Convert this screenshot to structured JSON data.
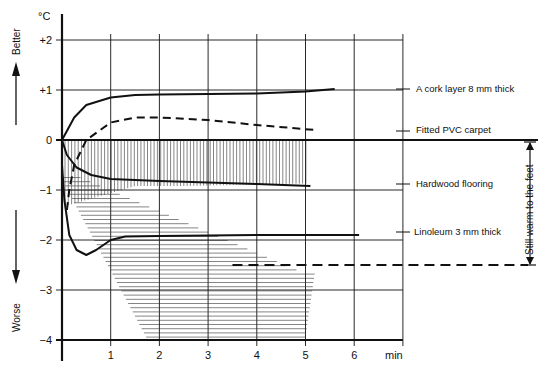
{
  "chart_data": {
    "type": "line",
    "title": "",
    "xlabel": "min",
    "ylabel": "°C",
    "xlim": [
      0,
      7
    ],
    "ylim": [
      -4,
      2
    ],
    "x_ticks": [
      "1",
      "2",
      "3",
      "4",
      "5",
      "6"
    ],
    "y_ticks": [
      "+2",
      "+1",
      "0",
      "−1",
      "−2",
      "−3",
      "−4"
    ],
    "grid": true,
    "annotations": {
      "better": "Better",
      "worse": "Worse",
      "warm_zone": "Still warm to the feet",
      "warm_threshold": -2.5
    },
    "series": [
      {
        "name": "A cork layer 8 mm thick",
        "style": "solid",
        "x": [
          0,
          0.25,
          0.5,
          1,
          1.5,
          2,
          3,
          4,
          5,
          5.6
        ],
        "y": [
          0,
          0.45,
          0.7,
          0.85,
          0.9,
          0.91,
          0.92,
          0.93,
          0.97,
          1.02
        ]
      },
      {
        "name": "Fitted PVC carpet",
        "style": "dashed",
        "x": [
          0.1,
          0.15,
          0.25,
          0.5,
          1,
          1.5,
          2,
          3,
          4,
          5.2
        ],
        "y": [
          -1.4,
          -1.0,
          -0.5,
          0,
          0.35,
          0.45,
          0.45,
          0.4,
          0.3,
          0.2
        ]
      },
      {
        "name": "Hardwood flooring",
        "style": "solid",
        "x": [
          0,
          0.1,
          0.3,
          0.6,
          1,
          1.5,
          2,
          3,
          4,
          5.1
        ],
        "y": [
          0,
          -0.3,
          -0.55,
          -0.7,
          -0.78,
          -0.8,
          -0.82,
          -0.85,
          -0.88,
          -0.92
        ]
      },
      {
        "name": "Linoleum 3 mm thick",
        "style": "solid",
        "x": [
          0,
          0.05,
          0.15,
          0.3,
          0.5,
          0.7,
          1,
          1.3,
          2,
          3,
          4,
          5,
          6.1
        ],
        "y": [
          -0.5,
          -1.2,
          -1.9,
          -2.2,
          -2.3,
          -2.2,
          -2.0,
          -1.93,
          -1.92,
          -1.91,
          -1.9,
          -1.9,
          -1.9
        ]
      }
    ]
  },
  "labels": {
    "unit": "°C",
    "x_unit": "min",
    "better": "Better",
    "worse": "Worse",
    "warm": "Still warm to the feet",
    "cork": "A cork layer 8 mm thick",
    "pvc": "Fitted PVC carpet",
    "hardwood": "Hardwood flooring",
    "linoleum": "Linoleum 3 mm thick"
  }
}
